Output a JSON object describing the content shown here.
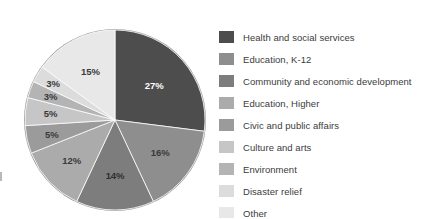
{
  "chart_data": {
    "type": "pie",
    "title": "",
    "legend_position": "right",
    "start_angle_clock": 12,
    "direction": "clockwise",
    "labels_shown": true,
    "label_suffix": "%",
    "categories": [
      "Health and social services",
      "Education, K-12",
      "Community and economic development",
      "Education, Higher",
      "Civic and public affairs",
      "Culture and arts",
      "Environment",
      "Disaster relief",
      "Other"
    ],
    "values": [
      27,
      16,
      14,
      12,
      5,
      5,
      3,
      3,
      15
    ],
    "value_labels": [
      "27%",
      "16%",
      "14%",
      "12%",
      "5%",
      "5%",
      "3%",
      "3%",
      "15%"
    ],
    "colors": [
      "#4d4d4d",
      "#8e8e8e",
      "#7d7d7d",
      "#ababab",
      "#9b9b9b",
      "#c6c6c6",
      "#b4b4b4",
      "#dcdcdc",
      "#e8e8e8"
    ],
    "label_text_colors": [
      "#ffffff",
      "#3a3a3a",
      "#2f2f2f",
      "#3a3a3a",
      "#3a3a3a",
      "#3a3a3a",
      "#3a3a3a",
      "#3a3a3a",
      "#3a3a3a"
    ],
    "label_radius_factor": [
      0.58,
      0.62,
      0.62,
      0.66,
      0.72,
      0.72,
      0.76,
      0.8,
      0.6
    ]
  },
  "legend": {
    "items": [
      {
        "label": "Health and social services",
        "color": "#4d4d4d"
      },
      {
        "label": "Education, K-12",
        "color": "#8e8e8e"
      },
      {
        "label": "Community and economic development",
        "color": "#7d7d7d"
      },
      {
        "label": "Education, Higher",
        "color": "#ababab"
      },
      {
        "label": "Civic and public affairs",
        "color": "#9b9b9b"
      },
      {
        "label": "Culture and arts",
        "color": "#c6c6c6"
      },
      {
        "label": "Environment",
        "color": "#b4b4b4"
      },
      {
        "label": "Disaster relief",
        "color": "#dcdcdc"
      },
      {
        "label": "Other",
        "color": "#e8e8e8"
      }
    ]
  }
}
